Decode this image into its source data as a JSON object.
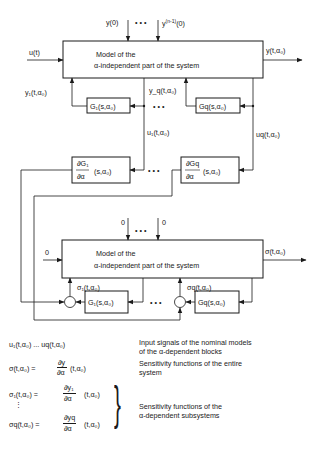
{
  "colors": {
    "ink": "#1a1a1a",
    "background": "#ffffff"
  },
  "top_system": {
    "initial_conditions": {
      "first": "y(0)",
      "last": "y",
      "last_sup": "(n-1)",
      "last_tail": "(0)",
      "dots": "• • •"
    },
    "input_label": "u(t)",
    "output_label": "y(t,α₀)",
    "block_line1": "Model of the",
    "block_line2": "α-independent part of the system",
    "feedback_1_label": "y₁(t,α₀)",
    "feedback_q_label": "y_q(t,α₀)",
    "block_g1": "G₁(s,α₀)",
    "block_gq": "Gq(s,α₀)",
    "dots": "• • •"
  },
  "sensitivity_blocks": {
    "u1_label": "u₁(t,α₀)",
    "uq_label": "uq(t,α₀)",
    "dg1_num": "∂G₁",
    "dg1_den": "∂α",
    "dg1_tail": "(s,α₀)",
    "dgq_num": "∂Gq",
    "dgq_den": "∂α",
    "dgq_tail": "(s,α₀)",
    "dots": "• • •"
  },
  "bottom_system": {
    "initial_conditions": {
      "first": "0",
      "last": "0",
      "dots": "• • •"
    },
    "input_label": "0",
    "output_label": "σ(t,α₀)",
    "block_line1": "Model of the",
    "block_line2": "α-independent part of the system",
    "sigma_1_label": "σ₁(t,α₀)",
    "sigma_q_label": "σq(t,α₀)",
    "block_g1": "G₁(s,α₀)",
    "block_gq": "Gq(s,α₀)",
    "dots": "• • •"
  },
  "legend": [
    {
      "symbol": "u₁(t,α₀)  ...  uq(t,α₀)",
      "description_line1": "Input signals of the nominal models",
      "description_line2": "of the α-dependent blocks"
    },
    {
      "symbol": "σ(t,α₀) = ∂y/∂α (t,α₀)",
      "description_line1": "Sensitivity functions of the entire",
      "description_line2": "system"
    },
    {
      "symbol": "σ₁(t,α₀) = ∂y₁/∂α (t,α₀) ... σq(t,α₀) = ∂yq/∂α (t,α₀)",
      "description_line1": "Sensitivity functions of the",
      "description_line2": "α-dependent subsystems"
    }
  ],
  "legend_symbols": {
    "u_row": "u₁(t,α₀)   ...  uq(t,α₀)",
    "sigma_lhs": "σ(t,α₀) =",
    "sigma_num": "∂y",
    "sigma_den": "∂α",
    "sigma_tail": "(t,α₀)",
    "sigma1_lhs": "σ₁(t,α₀) =",
    "sigma1_num": "∂y₁",
    "sigma1_den": "∂α",
    "sigma1_tail": "(t,α₀)",
    "vdots": "⋮",
    "sigmaq_lhs": "σq(t,α₀) =",
    "sigmaq_num": "∂yq",
    "sigmaq_den": "∂α",
    "sigmaq_tail": "(t,α₀)",
    "brace": "}"
  }
}
